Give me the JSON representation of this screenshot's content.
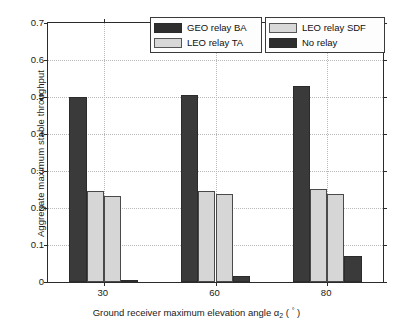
{
  "chart_data": {
    "type": "bar",
    "title": "",
    "xlabel": "Ground receiver maximum elevation angle α₂ ( ° )",
    "xlabel_parts": {
      "before": "Ground receiver maximum elevation angle ",
      "symbol": "α",
      "subscript": "2",
      "after": " ( ",
      "degree": "°",
      "tail": " )"
    },
    "ylabel": "Aggregate maximum stable throughput",
    "categories": [
      "30",
      "60",
      "80"
    ],
    "xtick_labels": [
      "30",
      "60",
      "80"
    ],
    "ytick_labels": [
      "0",
      "0.1",
      "0.2",
      "0.3",
      "0.4",
      "0.5",
      "0.6",
      "0.7"
    ],
    "ytick_values": [
      0,
      0.1,
      0.2,
      0.3,
      0.4,
      0.5,
      0.6,
      0.7
    ],
    "ylim": [
      0,
      0.7
    ],
    "grid": true,
    "legend_position": "top-center",
    "series": [
      {
        "name": "GEO relay BA",
        "color": "#3a3a3a",
        "values": [
          0.5,
          0.506,
          0.53
        ]
      },
      {
        "name": "LEO relay TA",
        "color": "#d6d6d6",
        "values": [
          0.245,
          0.247,
          0.252
        ]
      },
      {
        "name": "LEO relay SDF",
        "color": "#d6d6d6",
        "values": [
          0.232,
          0.239,
          0.238
        ]
      },
      {
        "name": "No relay",
        "color": "#2e2e2e",
        "values": [
          0.004,
          0.017,
          0.07
        ]
      }
    ]
  },
  "legend": {
    "left_entries": [
      {
        "label": "GEO relay BA",
        "swatch": "dark"
      },
      {
        "label": "LEO relay TA",
        "swatch": "light"
      }
    ],
    "right_entries": [
      {
        "label": "LEO relay SDF",
        "swatch": "light"
      },
      {
        "label": "No relay",
        "swatch": "dark"
      }
    ]
  },
  "colors": {
    "dark_bar": "#3a3a3a",
    "light_bar": "#d6d6d6",
    "axis": "#2b2b2b",
    "grid": "#b9b9b9",
    "background": "#ffffff"
  }
}
